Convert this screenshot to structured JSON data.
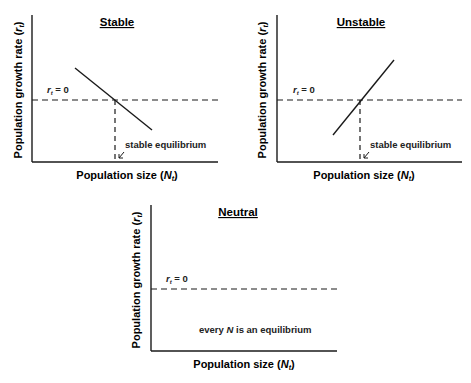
{
  "panels": [
    {
      "title": "Stable",
      "ylabel": "Population growth rate",
      "ylabel_var": "r",
      "ylabel_sub": "t",
      "xlabel": "Population size",
      "xlabel_var": "N",
      "xlabel_sub": "t",
      "zero_line_label_var": "r",
      "zero_line_label_sub": "t",
      "zero_line_label_eq": " = 0",
      "annotation": "stable equilibrium",
      "slope": "negative"
    },
    {
      "title": "Unstable",
      "ylabel": "Population growth rate",
      "ylabel_var": "r",
      "ylabel_sub": "t",
      "xlabel": "Population size",
      "xlabel_var": "N",
      "xlabel_sub": "t",
      "zero_line_label_var": "r",
      "zero_line_label_sub": "t",
      "zero_line_label_eq": " = 0",
      "annotation": "stable equilibrium",
      "slope": "positive"
    },
    {
      "title": "Neutral",
      "ylabel": "Population growth rate",
      "ylabel_var": "r",
      "ylabel_sub": "t",
      "xlabel": "Population size",
      "xlabel_var": "N",
      "xlabel_sub": "t",
      "zero_line_label_var": "r",
      "zero_line_label_sub": "t",
      "zero_line_label_eq": " = 0",
      "annotation_pre": "every ",
      "annotation_var": "N",
      "annotation_post": " is an equilibrium",
      "slope": "zero"
    }
  ],
  "colors": {
    "line": "#1a1a1a",
    "background": "#ffffff"
  }
}
